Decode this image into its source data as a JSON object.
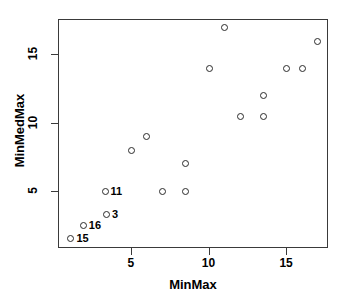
{
  "chart_data": {
    "type": "scatter",
    "title": "",
    "xlabel": "MinMax",
    "ylabel": "MinMedMax",
    "xlim": [
      0.3,
      17.7
    ],
    "ylim": [
      0.8,
      17.6
    ],
    "xticks": [
      5,
      10,
      15
    ],
    "yticks": [
      5,
      10,
      15
    ],
    "xtick_labels": [
      "5",
      "10",
      "15"
    ],
    "ytick_labels": [
      "5",
      "10",
      "15"
    ],
    "grid": false,
    "legend": false,
    "marker": "open-circle",
    "marker_color": "#2b2b2b",
    "frame_color": "#3a3a3a",
    "points": [
      {
        "x": 1.1,
        "y": 1.5,
        "label": "15"
      },
      {
        "x": 1.9,
        "y": 2.5,
        "label": "16"
      },
      {
        "x": 3.4,
        "y": 3.3,
        "label": "3"
      },
      {
        "x": 3.3,
        "y": 5.0,
        "label": "11"
      },
      {
        "x": 5.0,
        "y": 8.0,
        "label": ""
      },
      {
        "x": 6.0,
        "y": 9.0,
        "label": ""
      },
      {
        "x": 7.0,
        "y": 5.0,
        "label": ""
      },
      {
        "x": 8.5,
        "y": 5.0,
        "label": ""
      },
      {
        "x": 8.5,
        "y": 7.0,
        "label": ""
      },
      {
        "x": 10.0,
        "y": 14.0,
        "label": ""
      },
      {
        "x": 11.0,
        "y": 17.0,
        "label": ""
      },
      {
        "x": 12.0,
        "y": 10.5,
        "label": ""
      },
      {
        "x": 13.5,
        "y": 10.5,
        "label": ""
      },
      {
        "x": 13.5,
        "y": 12.0,
        "label": ""
      },
      {
        "x": 15.0,
        "y": 14.0,
        "label": ""
      },
      {
        "x": 16.0,
        "y": 14.0,
        "label": ""
      },
      {
        "x": 17.0,
        "y": 16.0,
        "label": ""
      }
    ]
  }
}
